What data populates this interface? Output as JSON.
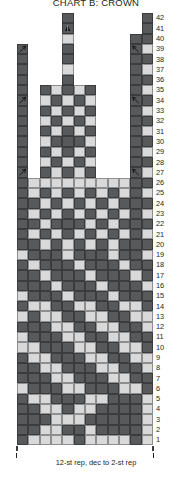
{
  "title": "CHART B: CROWN",
  "colors": {
    "dark": "#58595b",
    "light": "#d9d9d9",
    "empty": "#ffffff",
    "text": "#231f20"
  },
  "grid": {
    "columns": 12,
    "rows": 42,
    "cell_width": 11.33,
    "cell_height": 10.29,
    "row_numbers": [
      42,
      41,
      40,
      39,
      38,
      37,
      36,
      35,
      34,
      33,
      32,
      31,
      30,
      29,
      28,
      27,
      26,
      25,
      24,
      23,
      22,
      21,
      20,
      19,
      18,
      17,
      16,
      15,
      14,
      13,
      12,
      11,
      10,
      9,
      8,
      7,
      6,
      5,
      4,
      3,
      2,
      1
    ]
  },
  "repeat": {
    "label": "12-st rep, dec to 2-st rep"
  },
  "symbols": {
    "ssk": "left-leaning-decrease",
    "k2tog": "right-leaning-decrease",
    "cdd": "centered-double-decrease"
  },
  "chart_data": {
    "type": "heatmap",
    "title": "CHART B: CROWN",
    "xlabel": "",
    "ylabel": "",
    "legend": [
      "dark",
      "light"
    ],
    "note": "Knitting colorwork chart. Each row is 12 stitches wide at the base, decreasing toward the crown. 'd'=dark stitch, 'l'=light stitch, '.'=no stitch (outside worked area), 'S'=left decrease (dark), 'K'=right decrease (dark), 'C'=centered double decrease (dark).",
    "rows_top_to_bottom": [
      {
        "row": 42,
        "cells": [
          ".",
          ".",
          ".",
          ".",
          "d",
          ".",
          ".",
          ".",
          ".",
          ".",
          ".",
          "d"
        ]
      },
      {
        "row": 41,
        "cells": [
          ".",
          ".",
          ".",
          ".",
          "C",
          ".",
          ".",
          ".",
          ".",
          ".",
          ".",
          "d"
        ]
      },
      {
        "row": 40,
        "cells": [
          ".",
          ".",
          ".",
          ".",
          "l",
          ".",
          ".",
          ".",
          ".",
          ".",
          "d",
          "d"
        ]
      },
      {
        "row": 39,
        "cells": [
          "S",
          ".",
          ".",
          ".",
          "d",
          ".",
          ".",
          ".",
          ".",
          ".",
          "K",
          "l"
        ]
      },
      {
        "row": 38,
        "cells": [
          "d",
          ".",
          ".",
          ".",
          "d",
          ".",
          ".",
          ".",
          ".",
          ".",
          "d",
          "d"
        ]
      },
      {
        "row": 37,
        "cells": [
          "d",
          ".",
          ".",
          ".",
          "l",
          ".",
          ".",
          ".",
          ".",
          ".",
          "d",
          "l"
        ]
      },
      {
        "row": 36,
        "cells": [
          "d",
          ".",
          ".",
          ".",
          "d",
          ".",
          ".",
          ".",
          ".",
          ".",
          "d",
          "d"
        ]
      },
      {
        "row": 35,
        "cells": [
          "d",
          ".",
          "d",
          "l",
          "d",
          "l",
          "d",
          ".",
          ".",
          ".",
          "d",
          "l"
        ]
      },
      {
        "row": 34,
        "cells": [
          "S",
          ".",
          "l",
          "d",
          "l",
          "d",
          "l",
          ".",
          ".",
          ".",
          "K",
          "d"
        ]
      },
      {
        "row": 33,
        "cells": [
          "d",
          ".",
          "d",
          "l",
          "d",
          "l",
          "d",
          ".",
          ".",
          ".",
          "d",
          "l"
        ]
      },
      {
        "row": 32,
        "cells": [
          "d",
          ".",
          "l",
          "d",
          "l",
          "d",
          "l",
          ".",
          ".",
          ".",
          "d",
          "d"
        ]
      },
      {
        "row": 31,
        "cells": [
          "d",
          ".",
          "d",
          "l",
          "d",
          "l",
          "d",
          ".",
          ".",
          ".",
          "d",
          "l"
        ]
      },
      {
        "row": 30,
        "cells": [
          "d",
          ".",
          "l",
          "d",
          "d",
          "d",
          "l",
          ".",
          ".",
          ".",
          "d",
          "d"
        ]
      },
      {
        "row": 29,
        "cells": [
          "d",
          ".",
          "d",
          "l",
          "d",
          "l",
          "d",
          ".",
          ".",
          ".",
          "d",
          "l"
        ]
      },
      {
        "row": 28,
        "cells": [
          "d",
          ".",
          "l",
          "d",
          "l",
          "d",
          "l",
          ".",
          ".",
          ".",
          "d",
          "d"
        ]
      },
      {
        "row": 27,
        "cells": [
          "S",
          ".",
          "d",
          "l",
          "d",
          "l",
          "d",
          ".",
          ".",
          ".",
          "K",
          "l"
        ]
      },
      {
        "row": 26,
        "cells": [
          "d",
          "l",
          "l",
          "l",
          "l",
          "l",
          "l",
          "l",
          "l",
          "l",
          "d",
          "d"
        ]
      },
      {
        "row": 25,
        "cells": [
          "d",
          "l",
          "d",
          "l",
          "d",
          "l",
          "d",
          "l",
          "d",
          "l",
          "d",
          "l"
        ]
      },
      {
        "row": 24,
        "cells": [
          "d",
          "d",
          "l",
          "d",
          "l",
          "d",
          "l",
          "d",
          "l",
          "d",
          "d",
          "d"
        ]
      },
      {
        "row": 23,
        "cells": [
          "d",
          "l",
          "d",
          "l",
          "d",
          "l",
          "d",
          "l",
          "d",
          "l",
          "d",
          "l"
        ]
      },
      {
        "row": 22,
        "cells": [
          "d",
          "d",
          "l",
          "d",
          "d",
          "d",
          "l",
          "d",
          "l",
          "d",
          "d",
          "d"
        ]
      },
      {
        "row": 21,
        "cells": [
          "d",
          "l",
          "d",
          "l",
          "d",
          "l",
          "d",
          "l",
          "d",
          "l",
          "d",
          "l"
        ]
      },
      {
        "row": 20,
        "cells": [
          "d",
          "d",
          "l",
          "d",
          "l",
          "d",
          "l",
          "d",
          "l",
          "d",
          "d",
          "d"
        ]
      },
      {
        "row": 19,
        "cells": [
          "l",
          "d",
          "d",
          "d",
          "l",
          "d",
          "d",
          "d",
          "l",
          "d",
          "d",
          "l"
        ]
      },
      {
        "row": 18,
        "cells": [
          "d",
          "l",
          "d",
          "d",
          "d",
          "l",
          "d",
          "d",
          "d",
          "l",
          "d",
          "d"
        ]
      },
      {
        "row": 17,
        "cells": [
          "d",
          "d",
          "l",
          "d",
          "d",
          "d",
          "l",
          "d",
          "d",
          "d",
          "l",
          "d"
        ]
      },
      {
        "row": 16,
        "cells": [
          "d",
          "d",
          "d",
          "l",
          "d",
          "d",
          "d",
          "l",
          "d",
          "d",
          "d",
          "l"
        ]
      },
      {
        "row": 15,
        "cells": [
          "l",
          "d",
          "d",
          "d",
          "l",
          "d",
          "d",
          "d",
          "l",
          "d",
          "d",
          "d"
        ]
      },
      {
        "row": 14,
        "cells": [
          "d",
          "l",
          "l",
          "d",
          "d",
          "l",
          "l",
          "d",
          "d",
          "l",
          "l",
          "d"
        ]
      },
      {
        "row": 13,
        "cells": [
          "l",
          "d",
          "l",
          "l",
          "d",
          "d",
          "l",
          "l",
          "d",
          "d",
          "l",
          "l"
        ]
      },
      {
        "row": 12,
        "cells": [
          "d",
          "d",
          "d",
          "l",
          "l",
          "d",
          "d",
          "l",
          "l",
          "d",
          "d",
          "l"
        ]
      },
      {
        "row": 11,
        "cells": [
          "l",
          "d",
          "d",
          "d",
          "l",
          "l",
          "d",
          "d",
          "l",
          "l",
          "d",
          "d"
        ]
      },
      {
        "row": 10,
        "cells": [
          "l",
          "l",
          "d",
          "d",
          "d",
          "l",
          "l",
          "d",
          "d",
          "l",
          "l",
          "d"
        ]
      },
      {
        "row": 9,
        "cells": [
          "d",
          "l",
          "l",
          "d",
          "d",
          "d",
          "l",
          "l",
          "d",
          "d",
          "l",
          "l"
        ]
      },
      {
        "row": 8,
        "cells": [
          "d",
          "d",
          "l",
          "l",
          "d",
          "d",
          "d",
          "l",
          "l",
          "d",
          "d",
          "l"
        ]
      },
      {
        "row": 7,
        "cells": [
          "d",
          "d",
          "d",
          "l",
          "l",
          "d",
          "d",
          "d",
          "l",
          "l",
          "d",
          "d"
        ]
      },
      {
        "row": 6,
        "cells": [
          "l",
          "d",
          "d",
          "d",
          "l",
          "l",
          "d",
          "d",
          "d",
          "l",
          "l",
          "d"
        ]
      },
      {
        "row": 5,
        "cells": [
          "d",
          "l",
          "l",
          "d",
          "d",
          "d",
          "l",
          "l",
          "d",
          "d",
          "d",
          "l"
        ]
      },
      {
        "row": 4,
        "cells": [
          "d",
          "d",
          "l",
          "l",
          "d",
          "l",
          "l",
          "d",
          "d",
          "d",
          "d",
          "l"
        ]
      },
      {
        "row": 3,
        "cells": [
          "d",
          "d",
          "d",
          "l",
          "l",
          "l",
          "d",
          "d",
          "d",
          "d",
          "d",
          "l"
        ]
      },
      {
        "row": 2,
        "cells": [
          "d",
          "d",
          "l",
          "l",
          "d",
          "d",
          "l",
          "d",
          "d",
          "d",
          "d",
          "l"
        ]
      },
      {
        "row": 1,
        "cells": [
          "d",
          "l",
          "l",
          "l",
          "l",
          "d",
          "l",
          "l",
          "l",
          "l",
          "d",
          "l"
        ]
      }
    ]
  }
}
